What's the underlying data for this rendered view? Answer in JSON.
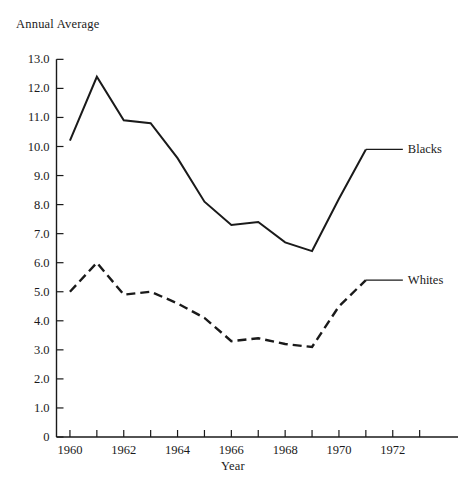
{
  "chart_data": {
    "type": "line",
    "title": "",
    "ylabel": "Annual Average",
    "xlabel": "Year",
    "xlim": [
      1959.5,
      1973.4
    ],
    "ylim": [
      0,
      13.0
    ],
    "grid": false,
    "legend_position": "right-inline-labels",
    "y_ticks": [
      "13.0",
      "12.0",
      "11.0",
      "10.0",
      "9.0",
      "8.0",
      "7.0",
      "6.0",
      "5.0",
      "4.0",
      "3.0",
      "2.0",
      "1.0",
      "0"
    ],
    "y_tick_values": [
      13.0,
      12.0,
      11.0,
      10.0,
      9.0,
      8.0,
      7.0,
      6.0,
      5.0,
      4.0,
      3.0,
      2.0,
      1.0,
      0
    ],
    "x_ticks": [
      "1960",
      "1962",
      "1964",
      "1966",
      "1968",
      "1970",
      "1972"
    ],
    "x_tick_values": [
      1960,
      1962,
      1964,
      1966,
      1968,
      1970,
      1972
    ],
    "x_minor_tick_values": [
      1960,
      1961,
      1962,
      1963,
      1964,
      1965,
      1966,
      1967,
      1968,
      1969,
      1970,
      1971,
      1972,
      1973
    ],
    "x": [
      1960,
      1961,
      1962,
      1963,
      1964,
      1965,
      1966,
      1967,
      1968,
      1969,
      1970,
      1971
    ],
    "series": [
      {
        "name": "Blacks",
        "style": "solid",
        "color": "#1a1a1a",
        "values": [
          10.2,
          12.4,
          10.9,
          10.8,
          9.6,
          8.1,
          7.3,
          7.4,
          6.7,
          6.4,
          8.2,
          9.9
        ]
      },
      {
        "name": "Whites",
        "style": "dashed",
        "color": "#1a1a1a",
        "values": [
          5.0,
          6.0,
          4.9,
          5.0,
          4.6,
          4.1,
          3.3,
          3.4,
          3.2,
          3.1,
          4.5,
          5.4
        ]
      }
    ]
  },
  "labels": {
    "y_axis_title": "Annual Average",
    "x_axis_title": "Year",
    "series_blacks": "Blacks",
    "series_whites": "Whites"
  }
}
